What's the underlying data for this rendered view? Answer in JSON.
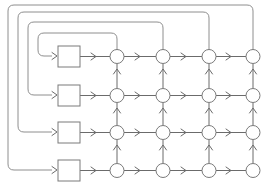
{
  "diagram": {
    "canvas": {
      "width": 265,
      "height": 183,
      "background": "#ffffff"
    },
    "colors": {
      "edge": "#6b6b6b",
      "loop": "#8e8e8e",
      "node_stroke": "#7a7a7a",
      "node_fill": "#ffffff",
      "square_stroke": "#7a7a7a",
      "square_fill": "#ffffff"
    },
    "geometry": {
      "node_radius": 7,
      "square_width": 22,
      "square_height": 20,
      "square_x": 58,
      "column_x": [
        117,
        163,
        209,
        253
      ],
      "row_y": [
        57,
        96,
        132,
        170
      ],
      "square_center_y": [
        56,
        95,
        132,
        170
      ],
      "loop_left_x": [
        38,
        28,
        18,
        8
      ],
      "loop_top_y": [
        33,
        22,
        12,
        5
      ],
      "loop_entry_x": [
        48,
        44,
        40,
        36
      ]
    },
    "counts": {
      "rows": 4,
      "columns": 4,
      "nodes": 16,
      "squares": 4,
      "feedback_loops": 4
    },
    "squares": [
      {
        "id": "pe-0",
        "row": 0,
        "label": ""
      },
      {
        "id": "pe-1",
        "row": 1,
        "label": ""
      },
      {
        "id": "pe-2",
        "row": 2,
        "label": ""
      },
      {
        "id": "pe-3",
        "row": 3,
        "label": ""
      }
    ],
    "nodes": [
      {
        "id": "n-0-0",
        "row": 0,
        "col": 0,
        "label": ""
      },
      {
        "id": "n-0-1",
        "row": 0,
        "col": 1,
        "label": ""
      },
      {
        "id": "n-0-2",
        "row": 0,
        "col": 2,
        "label": ""
      },
      {
        "id": "n-0-3",
        "row": 0,
        "col": 3,
        "label": ""
      },
      {
        "id": "n-1-0",
        "row": 1,
        "col": 0,
        "label": ""
      },
      {
        "id": "n-1-1",
        "row": 1,
        "col": 1,
        "label": ""
      },
      {
        "id": "n-1-2",
        "row": 1,
        "col": 2,
        "label": ""
      },
      {
        "id": "n-1-3",
        "row": 1,
        "col": 3,
        "label": ""
      },
      {
        "id": "n-2-0",
        "row": 2,
        "col": 0,
        "label": ""
      },
      {
        "id": "n-2-1",
        "row": 2,
        "col": 1,
        "label": ""
      },
      {
        "id": "n-2-2",
        "row": 2,
        "col": 2,
        "label": ""
      },
      {
        "id": "n-2-3",
        "row": 2,
        "col": 3,
        "label": ""
      },
      {
        "id": "n-3-0",
        "row": 3,
        "col": 0,
        "label": ""
      },
      {
        "id": "n-3-1",
        "row": 3,
        "col": 1,
        "label": ""
      },
      {
        "id": "n-3-2",
        "row": 3,
        "col": 2,
        "label": ""
      },
      {
        "id": "n-3-3",
        "row": 3,
        "col": 3,
        "label": ""
      }
    ],
    "feedback_loops": [
      {
        "id": "loop-0",
        "from_column": 0,
        "to_square": 0,
        "nesting": "innermost"
      },
      {
        "id": "loop-1",
        "from_column": 1,
        "to_square": 1,
        "nesting": "inner"
      },
      {
        "id": "loop-2",
        "from_column": 2,
        "to_square": 2,
        "nesting": "outer"
      },
      {
        "id": "loop-3",
        "from_column": 3,
        "to_square": 3,
        "nesting": "outermost"
      }
    ],
    "edge_directions": {
      "horizontal": "left-to-right",
      "vertical": "bottom-to-top",
      "feedback": "column-top to row-square"
    }
  }
}
